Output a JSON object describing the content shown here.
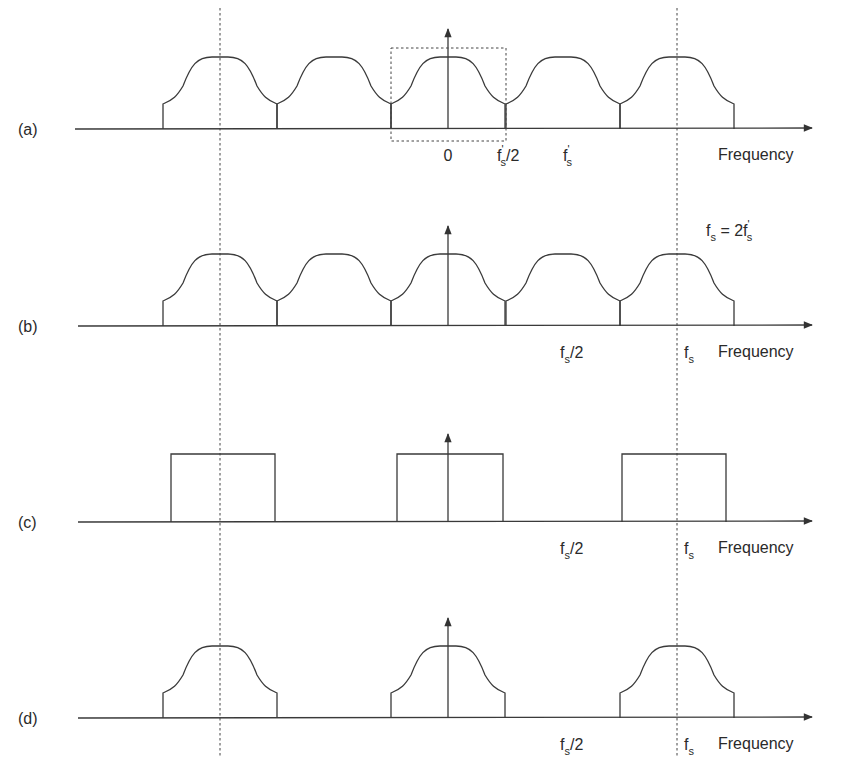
{
  "figure": {
    "panels": [
      {
        "id": "a",
        "label": "(a)",
        "axis_y": 129,
        "xlabel": "Frequency",
        "shape": "bumps",
        "centers": [
          220,
          334,
          448,
          563,
          677
        ],
        "ticks": [
          {
            "text_main": "0",
            "x": 448
          },
          {
            "text_main": "f",
            "sub": "s",
            "prime": "'",
            "suffix": "/2",
            "x": 497
          },
          {
            "text_main": "f",
            "sub": "s",
            "prime": "'",
            "suffix": "",
            "x": 563
          }
        ]
      },
      {
        "id": "b",
        "label": "(b)",
        "axis_y": 326,
        "xlabel": "Frequency",
        "shape": "bumps",
        "centers": [
          220,
          334,
          448,
          563,
          677
        ],
        "ticks": [
          {
            "text_main": "f",
            "sub": "s",
            "suffix": "/2",
            "x": 560
          },
          {
            "text_main": "f",
            "sub": "s",
            "suffix": "",
            "x": 684
          }
        ]
      },
      {
        "id": "c",
        "label": "(c)",
        "axis_y": 522,
        "xlabel": "Frequency",
        "shape": "rects",
        "rects": [
          [
            171,
            275
          ],
          [
            397,
            503
          ],
          [
            622,
            726
          ]
        ],
        "ticks": [
          {
            "text_main": "f",
            "sub": "s",
            "suffix": "/2",
            "x": 560
          },
          {
            "text_main": "f",
            "sub": "s",
            "suffix": "",
            "x": 684
          }
        ]
      },
      {
        "id": "d",
        "label": "(d)",
        "axis_y": 718,
        "xlabel": "Frequency",
        "shape": "bumps",
        "centers": [
          220,
          448,
          677
        ],
        "ticks": [
          {
            "text_main": "f",
            "sub": "s",
            "suffix": "/2",
            "x": 560
          },
          {
            "text_main": "f",
            "sub": "s",
            "suffix": "",
            "x": 684
          }
        ]
      }
    ],
    "relation": {
      "text": "f",
      "sub": "s",
      "rest": " = 2f",
      "sub2": "s",
      "prime": "'"
    },
    "reference_lines_x": [
      220,
      677
    ],
    "center_x": 448
  }
}
